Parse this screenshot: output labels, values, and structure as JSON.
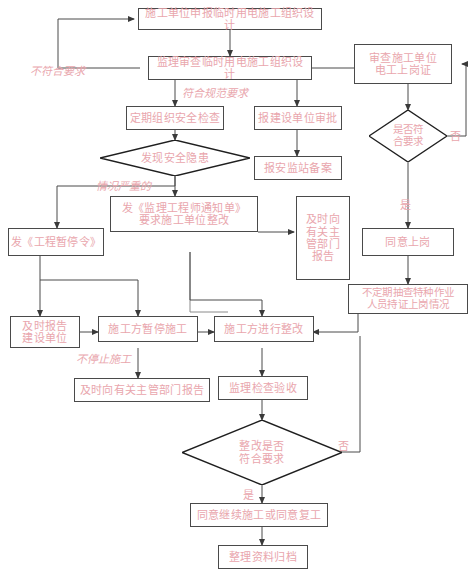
{
  "diagram": {
    "text_color": "#e9a6ad",
    "line_color": "#4a4a4a",
    "background": "#ffffff",
    "nodes": [
      {
        "id": "n1",
        "label": "施工单位申报临时用电施工组织设计",
        "shape": "process"
      },
      {
        "id": "n2",
        "label": "监理审查临时用电施工组织设计",
        "shape": "process"
      },
      {
        "id": "n3",
        "label": "审查施工单位\n电工上岗证",
        "shape": "process"
      },
      {
        "id": "n4",
        "label": "定期组织安全检查",
        "shape": "process"
      },
      {
        "id": "n5",
        "label": "报建设单位审批",
        "shape": "process"
      },
      {
        "id": "n6",
        "label": "报安监站备案",
        "shape": "process"
      },
      {
        "id": "n7",
        "label": "发现安全隐患",
        "shape": "decision"
      },
      {
        "id": "n8",
        "label": "是否符\n合要求",
        "shape": "decision"
      },
      {
        "id": "n9",
        "label": "发《监理工程师通知单》\n要求施工单位整改",
        "shape": "process"
      },
      {
        "id": "n10",
        "label": "及时向\n有关主\n管部门\n报告",
        "shape": "process"
      },
      {
        "id": "n11",
        "label": "同意上岗",
        "shape": "process"
      },
      {
        "id": "n12",
        "label": "发《工程暂停令》",
        "shape": "process"
      },
      {
        "id": "n13",
        "label": "不定期抽查特种作业\n人员持证上岗情况",
        "shape": "process"
      },
      {
        "id": "n14",
        "label": "及时报告\n建设单位",
        "shape": "process"
      },
      {
        "id": "n15",
        "label": "施工方暂停施工",
        "shape": "process"
      },
      {
        "id": "n16",
        "label": "施工方进行整改",
        "shape": "process"
      },
      {
        "id": "n17",
        "label": "及时向有关主管部门报告",
        "shape": "process"
      },
      {
        "id": "n18",
        "label": "监理检查验收",
        "shape": "process"
      },
      {
        "id": "n19",
        "label": "整改是否\n符合要求",
        "shape": "decision"
      },
      {
        "id": "n20",
        "label": "同意继续施工或同意复工",
        "shape": "process"
      },
      {
        "id": "n21",
        "label": "整理资料归档",
        "shape": "process"
      }
    ],
    "edge_labels": [
      {
        "id": "e1",
        "text": "不符合要求"
      },
      {
        "id": "e2",
        "text": "符合规范要求"
      },
      {
        "id": "e3",
        "text": "情况严重的"
      },
      {
        "id": "e4",
        "text": "不停止施工"
      }
    ],
    "branch_labels": [
      {
        "id": "b1",
        "text": "否"
      },
      {
        "id": "b2",
        "text": "是"
      },
      {
        "id": "b3",
        "text": "否"
      },
      {
        "id": "b4",
        "text": "是"
      }
    ]
  }
}
